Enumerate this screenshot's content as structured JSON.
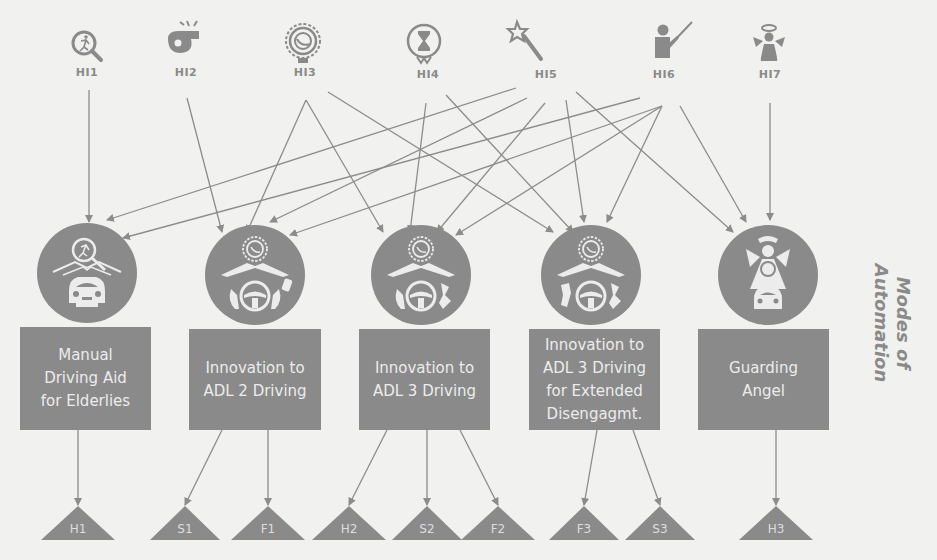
{
  "title": "Modes of Automation",
  "colors": {
    "background": "#f1f1f0",
    "node_fill": "#8a8a8a",
    "icon_light": "#ececec",
    "arrow": "#8c8c8c",
    "label": "#8a8a8a"
  },
  "hmi_inputs": [
    {
      "id": "HI1",
      "label": "HI1",
      "icon": "search-pedestrian-icon"
    },
    {
      "id": "HI2",
      "label": "HI2",
      "icon": "whistle-icon"
    },
    {
      "id": "HI3",
      "label": "HI3",
      "icon": "speedometer-badge-icon"
    },
    {
      "id": "HI4",
      "label": "HI4",
      "icon": "hourglass-badge-icon"
    },
    {
      "id": "HI5",
      "label": "HI5",
      "icon": "magic-wand-icon"
    },
    {
      "id": "HI6",
      "label": "HI6",
      "icon": "teacher-pointer-icon"
    },
    {
      "id": "HI7",
      "label": "HI7",
      "icon": "angel-icon"
    }
  ],
  "modes": [
    {
      "id": "M1",
      "label": "Manual Driving Aid for Elderlies",
      "lines": [
        "Manual",
        "Driving Aid",
        "for Elderlies"
      ],
      "icon": "pedestrian-search-car-icon"
    },
    {
      "id": "M2",
      "label": "Innovation to ADL 2 Driving",
      "lines": [
        "Innovation to",
        "ADL 2 Driving"
      ],
      "icon": "badge-road-steering-hands-icon"
    },
    {
      "id": "M3",
      "label": "Innovation to ADL 3 Driving",
      "lines": [
        "Innovation to",
        "ADL 3 Driving"
      ],
      "icon": "badge-road-steering-hands-icon"
    },
    {
      "id": "M4",
      "label": "Innovation to ADL 3 Driving for Extended Disengagmt.",
      "lines": [
        "Innovation to",
        "ADL 3 Driving",
        "for Extended",
        "Disengagmt."
      ],
      "icon": "badge-road-steering-free-hands-icon"
    },
    {
      "id": "M5",
      "label": "Guarding Angel",
      "lines": [
        "Guarding",
        "Angel"
      ],
      "icon": "angel-car-icon"
    }
  ],
  "outcomes": [
    {
      "id": "H1",
      "label": "H1",
      "from": "M1"
    },
    {
      "id": "S1",
      "label": "S1",
      "from": "M2"
    },
    {
      "id": "F1",
      "label": "F1",
      "from": "M2"
    },
    {
      "id": "H2",
      "label": "H2",
      "from": "M3"
    },
    {
      "id": "S2",
      "label": "S2",
      "from": "M3"
    },
    {
      "id": "F2",
      "label": "F2",
      "from": "M3"
    },
    {
      "id": "F3",
      "label": "F3",
      "from": "M4"
    },
    {
      "id": "S3",
      "label": "S3",
      "from": "M4"
    },
    {
      "id": "H3",
      "label": "H3",
      "from": "M5"
    }
  ],
  "input_edges": [
    [
      "HI1",
      "M1"
    ],
    [
      "HI2",
      "M2"
    ],
    [
      "HI3",
      "M2"
    ],
    [
      "HI3",
      "M3"
    ],
    [
      "HI3",
      "M4"
    ],
    [
      "HI4",
      "M3"
    ],
    [
      "HI4",
      "M4"
    ],
    [
      "HI5",
      "M1"
    ],
    [
      "HI5",
      "M2"
    ],
    [
      "HI5",
      "M3"
    ],
    [
      "HI5",
      "M4"
    ],
    [
      "HI5",
      "M5"
    ],
    [
      "HI6",
      "M1"
    ],
    [
      "HI6",
      "M2"
    ],
    [
      "HI6",
      "M3"
    ],
    [
      "HI6",
      "M4"
    ],
    [
      "HI6",
      "M5"
    ],
    [
      "HI7",
      "M5"
    ]
  ],
  "side_label": {
    "line1": "Modes of",
    "line2": "Automation"
  }
}
